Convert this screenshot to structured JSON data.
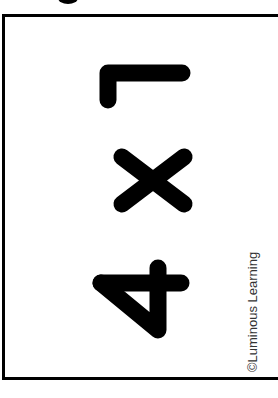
{
  "figure": {
    "expression": "4 × 1",
    "orientation": "rotated 90° clockwise",
    "digits": [
      "4",
      "×",
      "1"
    ],
    "credit": "©Luminous Learning",
    "colors": {
      "ink": "#000000",
      "background": "#ffffff",
      "credit_text": "#333333"
    }
  }
}
